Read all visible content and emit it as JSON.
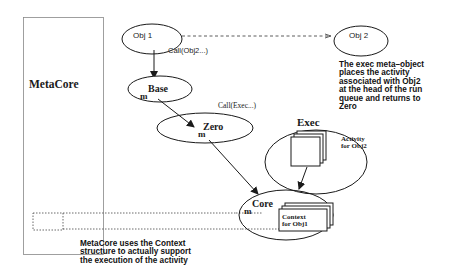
{
  "diagram": {
    "metacore": {
      "label": "MetaCore"
    },
    "nodes": {
      "obj1": {
        "label": "Obj 1"
      },
      "obj2": {
        "label": "Obj 2"
      },
      "base": {
        "label": "Base",
        "marker": "m"
      },
      "zero": {
        "label": "Zero",
        "marker": "m"
      },
      "exec": {
        "label": "Exec"
      },
      "core": {
        "label": "Core",
        "marker": "m"
      }
    },
    "edge_labels": {
      "call_obj2": "Call(Obj2...)",
      "call_exec": "Call(Exec...)"
    },
    "stacks": {
      "activity": [
        "Activity",
        "for Obj2"
      ],
      "context": [
        "Context",
        "for Obj1"
      ]
    },
    "notes": {
      "exec_note": [
        "The exec meta–object",
        "places the activity",
        "associated with Obj2",
        "at the head of the run",
        "queue and returns to",
        "Zero"
      ],
      "metacore_note": [
        "MetaCore uses the Context",
        "structure to actually support",
        "the execution of the activity"
      ]
    },
    "colors": {
      "stroke": "#1a1a1a",
      "dotted": "#444444",
      "background": "#ffffff"
    }
  }
}
